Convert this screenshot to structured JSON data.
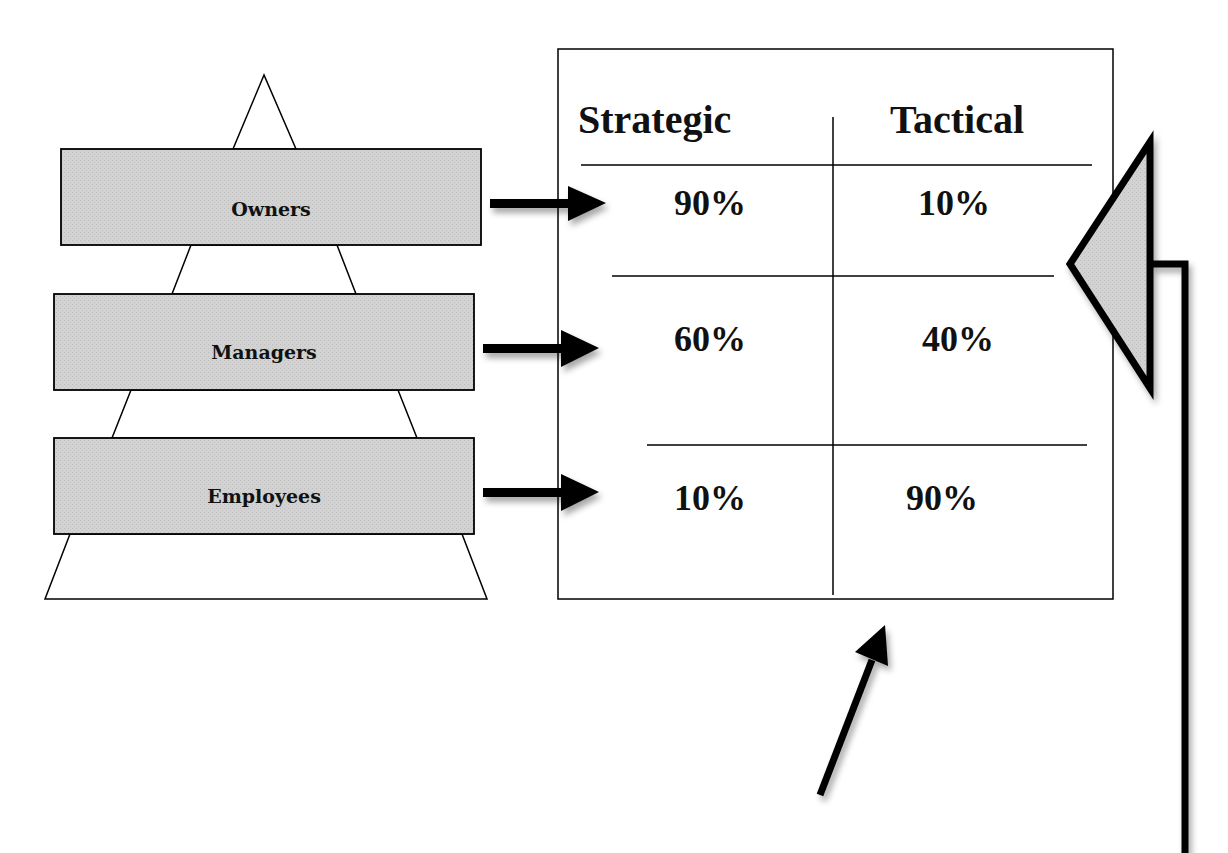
{
  "pyramid": {
    "levels": [
      {
        "label": "Owners"
      },
      {
        "label": "Managers"
      },
      {
        "label": "Employees"
      }
    ]
  },
  "table": {
    "headers": [
      "Strategic",
      "Tactical"
    ],
    "rows": [
      {
        "level": "Owners",
        "strategic": "90%",
        "tactical": "10%"
      },
      {
        "level": "Managers",
        "strategic": "60%",
        "tactical": "40%"
      },
      {
        "level": "Employees",
        "strategic": "10%",
        "tactical": "90%"
      }
    ]
  },
  "colors": {
    "box_fill": "#cfcfcf",
    "stroke": "#000000",
    "background": "#ffffff"
  }
}
